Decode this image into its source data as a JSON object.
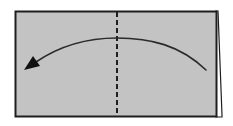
{
  "diagram": {
    "type": "origami-fold-step",
    "paper": {
      "fill": "#c3c3c3",
      "stroke": "#1e1e1e",
      "x": 15,
      "y": 11,
      "width": 203,
      "height": 106
    },
    "back_layer": {
      "fill": "#ffffff",
      "stroke": "#1e1e1e"
    },
    "fold_line": {
      "style": "dashed",
      "type": "valley-fold",
      "x": 117,
      "color": "#1e1e1e"
    },
    "arrow": {
      "direction": "right-to-left",
      "start": [
        205,
        70
      ],
      "end": [
        24,
        70
      ],
      "peak_y": 38,
      "color": "#1e1e1e"
    }
  },
  "colors": {
    "background": "#ffffff",
    "paper": "#c3c3c3",
    "line": "#1e1e1e"
  }
}
